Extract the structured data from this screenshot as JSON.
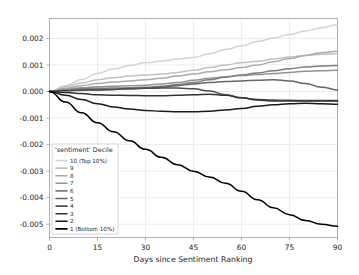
{
  "chart_data": {
    "type": "line",
    "title": "",
    "xlabel": "Days since Sentiment Ranking",
    "ylabel": "",
    "xlim": [
      0,
      90
    ],
    "ylim": [
      -0.0055,
      0.00275
    ],
    "grid": true,
    "legend_position": "lower left",
    "legend_title": "'sentiment' Decile",
    "xticks": [
      0,
      15,
      30,
      45,
      60,
      75,
      90
    ],
    "xtick_labels": [
      "0",
      "15",
      "30",
      "45",
      "60",
      "75",
      "90"
    ],
    "yticks": [
      0.002,
      0.001,
      0.0,
      -0.001,
      -0.002,
      -0.003,
      -0.004,
      -0.005
    ],
    "ytick_labels": [
      "0.002",
      "0.001",
      "0.000",
      "-0.001",
      "-0.002",
      "-0.003",
      "-0.004",
      "-0.005"
    ],
    "x": [
      0,
      5,
      10,
      15,
      20,
      25,
      30,
      35,
      40,
      45,
      50,
      55,
      60,
      65,
      70,
      75,
      80,
      85,
      90
    ],
    "series": [
      {
        "name": "10 (Top 10%)",
        "label": "10 (Top 10%)",
        "color": "#d4d4d4",
        "values": [
          0.0,
          0.00022,
          0.00045,
          0.00068,
          0.00085,
          0.00098,
          0.00108,
          0.00115,
          0.00122,
          0.00128,
          0.00142,
          0.00158,
          0.00172,
          0.00188,
          0.00202,
          0.00215,
          0.00228,
          0.0024,
          0.00252
        ]
      },
      {
        "name": "9",
        "label": "9",
        "color": "#c2c2c2",
        "values": [
          0.0,
          0.00018,
          0.00032,
          0.00044,
          0.00052,
          0.00058,
          0.00062,
          0.00066,
          0.00072,
          0.0008,
          0.0009,
          0.001,
          0.00108,
          0.00114,
          0.00122,
          0.0013,
          0.00136,
          0.0014,
          0.00142
        ]
      },
      {
        "name": "8",
        "label": "8",
        "color": "#ababab",
        "values": [
          0.0,
          0.00012,
          0.00022,
          0.0003,
          0.00036,
          0.0004,
          0.00044,
          0.0005,
          0.00058,
          0.00066,
          0.00074,
          0.00082,
          0.0009,
          0.001,
          0.00112,
          0.00124,
          0.00136,
          0.00146,
          0.00152
        ]
      },
      {
        "name": "7",
        "label": "7",
        "color": "#949494",
        "values": [
          0.0,
          8e-05,
          0.00014,
          0.00018,
          0.0002,
          0.00022,
          0.00024,
          0.00028,
          0.00034,
          0.00042,
          0.0005,
          0.00056,
          0.0006,
          0.00064,
          0.00068,
          0.00072,
          0.00076,
          0.00078,
          0.0008
        ]
      },
      {
        "name": "6",
        "label": "6",
        "color": "#7d7d7d",
        "values": [
          0.0,
          6e-05,
          0.0001,
          0.00012,
          0.00013,
          0.00014,
          0.00016,
          0.0002,
          0.00026,
          0.00034,
          0.00044,
          0.00054,
          0.00062,
          0.0007,
          0.00078,
          0.00086,
          0.00092,
          0.00096,
          0.00098
        ]
      },
      {
        "name": "5",
        "label": "5",
        "color": "#666666",
        "values": [
          0.0,
          4e-05,
          6e-05,
          7e-05,
          8e-05,
          0.0001,
          0.00012,
          0.00016,
          0.00022,
          0.00028,
          0.00034,
          0.00038,
          0.0004,
          0.00042,
          0.00044,
          0.0004,
          0.0003,
          0.00016,
          6e-05
        ]
      },
      {
        "name": "4",
        "label": "4",
        "color": "#4d4d4d",
        "values": [
          0.0,
          3e-05,
          5e-05,
          6e-05,
          8e-05,
          0.0001,
          0.00012,
          0.00013,
          0.00013,
          0.0001,
          2e-05,
          -0.00012,
          -0.00024,
          -0.0003,
          -0.00032,
          -0.00033,
          -0.00034,
          -0.00034,
          -0.00034
        ]
      },
      {
        "name": "3",
        "label": "3",
        "color": "#333333",
        "values": [
          0.0,
          -4e-05,
          -8e-05,
          -0.00012,
          -0.00014,
          -0.00015,
          -0.00016,
          -0.00016,
          -0.00014,
          -0.00012,
          -0.0001,
          -0.00014,
          -0.00024,
          -0.00032,
          -0.00036,
          -0.00036,
          -0.00036,
          -0.00036,
          -0.00036
        ]
      },
      {
        "name": "2",
        "label": "2",
        "color": "#1a1a1a",
        "values": [
          0.0,
          -0.00014,
          -0.0003,
          -0.00046,
          -0.00058,
          -0.00066,
          -0.00072,
          -0.00074,
          -0.00076,
          -0.00076,
          -0.00074,
          -0.0007,
          -0.00064,
          -0.00056,
          -0.0005,
          -0.00046,
          -0.00044,
          -0.00046,
          -0.00048
        ]
      },
      {
        "name": "1 (Bottom 10%)",
        "label": "1 (Bottom 10%)",
        "color": "#000000",
        "values": [
          0.0,
          -0.0004,
          -0.0008,
          -0.00118,
          -0.00152,
          -0.00186,
          -0.00218,
          -0.00248,
          -0.00276,
          -0.003,
          -0.00322,
          -0.00346,
          -0.00376,
          -0.00408,
          -0.00438,
          -0.00464,
          -0.00486,
          -0.005,
          -0.00508
        ]
      }
    ]
  },
  "legend": {
    "title": "'sentiment' Decile",
    "items": [
      {
        "label": "10 (Top 10%)",
        "color": "#d4d4d4"
      },
      {
        "label": "9",
        "color": "#c2c2c2"
      },
      {
        "label": "8",
        "color": "#ababab"
      },
      {
        "label": "7",
        "color": "#949494"
      },
      {
        "label": "6",
        "color": "#7d7d7d"
      },
      {
        "label": "5",
        "color": "#666666"
      },
      {
        "label": "4",
        "color": "#4d4d4d"
      },
      {
        "label": "3",
        "color": "#333333"
      },
      {
        "label": "2",
        "color": "#1a1a1a"
      },
      {
        "label": "1 (Bottom 10%)",
        "color": "#000000"
      }
    ]
  },
  "colors": {
    "background": "#ffffff",
    "axis": "#b0b0b0",
    "grid": "#e8e8e8",
    "text": "#262626"
  }
}
